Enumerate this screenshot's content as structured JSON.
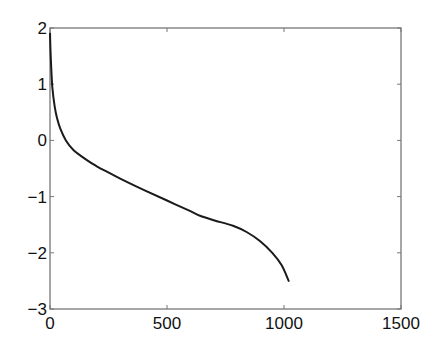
{
  "chart_data": {
    "type": "line",
    "title": "",
    "xlabel": "",
    "ylabel": "",
    "xlim": [
      0,
      1500
    ],
    "ylim": [
      -3,
      2
    ],
    "grid": false,
    "legend": null,
    "x_ticks": [
      0,
      500,
      1000,
      1500
    ],
    "y_ticks": [
      -3,
      -2,
      -1,
      0,
      1,
      2
    ],
    "x_tick_labels": [
      "0",
      "500",
      "1000",
      "1500"
    ],
    "y_tick_labels": [
      "-3",
      "-2",
      "-1",
      "0",
      "1",
      "2"
    ],
    "series": [
      {
        "name": "curve",
        "color": "#1a1a1a",
        "x": [
          0,
          2,
          5,
          10,
          20,
          30,
          45,
          68,
          100,
          150,
          200,
          235,
          300,
          400,
          500,
          600,
          641,
          700,
          782,
          840,
          897,
          950,
          990,
          1020
        ],
        "y": [
          1.9,
          1.6,
          1.3,
          0.95,
          0.6,
          0.4,
          0.2,
          0.0,
          -0.17,
          -0.33,
          -0.46,
          -0.54,
          -0.68,
          -0.88,
          -1.07,
          -1.26,
          -1.34,
          -1.42,
          -1.52,
          -1.63,
          -1.79,
          -2.0,
          -2.22,
          -2.5
        ]
      }
    ]
  }
}
